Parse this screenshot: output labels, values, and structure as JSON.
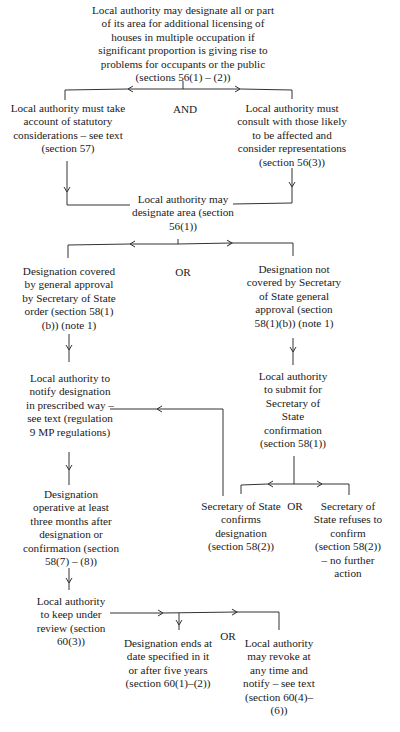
{
  "flowchart": {
    "nodes": {
      "start": "Local authority may designate all or part of its area for additional licensing of houses in multiple occupation if significant proportion is giving rise to problems for occupants or the public (sections 56(1) – (2))",
      "statutory": "Local authority must take account of statutory considerations – see text (section 57)",
      "consult": "Local authority must consult with those likely to be affected and consider representations (section 56(3))",
      "designate": "Local authority may designate area (section 56(1))",
      "covered": "Designation covered by general approval by Secretary of State order (section 58(1)(b)) (note 1)",
      "not_covered": "Designation not covered by Secretary of State general approval (section 58(1)(b)) (note 1)",
      "notify": "Local authority to notify designation in prescribed way – see text (regulation 9 MP regulations)",
      "submit": "Local authority to submit for Secretary of State confirmation (section 58(1))",
      "operative": "Designation operative at least three months after designation or confirmation (section 58(7) – (8))",
      "confirms": "Secretary of State confirms designation (section 58(2))",
      "refuses": "Secretary of State refuses to confirm (section 58(2)) – no further action",
      "review": "Local authority to keep under review (section 60(3))",
      "ends": "Designation ends at date specified in it or after five years (section 60(1)–(2))",
      "revoke": "Local authority may revoke at any time and notify – see text (section 60(4)–(6))"
    },
    "connectors": {
      "and_1": "AND",
      "or_1": "OR",
      "or_2": "OR",
      "or_3": "OR"
    },
    "edges": [
      {
        "from": "start",
        "to": "statutory"
      },
      {
        "from": "start",
        "to": "consult"
      },
      {
        "from": "statutory",
        "to": "designate"
      },
      {
        "from": "consult",
        "to": "designate"
      },
      {
        "from": "designate",
        "to": "covered"
      },
      {
        "from": "designate",
        "to": "not_covered"
      },
      {
        "from": "covered",
        "to": "notify"
      },
      {
        "from": "not_covered",
        "to": "submit"
      },
      {
        "from": "submit",
        "to": "confirms"
      },
      {
        "from": "submit",
        "to": "refuses"
      },
      {
        "from": "confirms",
        "to": "notify"
      },
      {
        "from": "notify",
        "to": "operative"
      },
      {
        "from": "operative",
        "to": "review"
      },
      {
        "from": "review",
        "to": "ends"
      },
      {
        "from": "review",
        "to": "revoke"
      }
    ]
  }
}
